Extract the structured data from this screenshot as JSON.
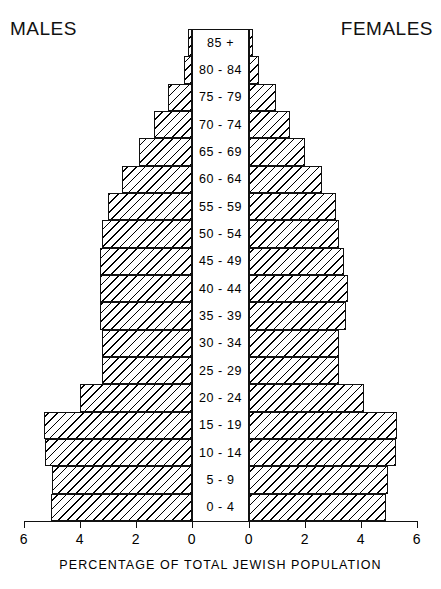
{
  "headers": {
    "left": "MALES",
    "right": "FEMALES"
  },
  "axis_title": "PERCENTAGE OF TOTAL JEWISH POPULATION",
  "chart_data": {
    "type": "bar",
    "subtype": "population-pyramid",
    "title": "",
    "xlabel": "PERCENTAGE OF TOTAL JEWISH POPULATION",
    "ylabel": "",
    "grid": false,
    "legend": [
      "MALES",
      "FEMALES"
    ],
    "legend_position": "top-left-and-top-right",
    "xlim": [
      0,
      6
    ],
    "xticks": [
      6,
      4,
      2,
      0,
      0,
      2,
      4,
      6
    ],
    "xtick_labels": [
      "6",
      "4",
      "2",
      "0",
      "0",
      "2",
      "4",
      "6"
    ],
    "categories": [
      "85 +",
      "80 - 84",
      "75 - 79",
      "70 - 74",
      "65 - 69",
      "60 - 64",
      "55 - 59",
      "50 - 54",
      "45 - 49",
      "40 - 44",
      "35 - 39",
      "30 - 34",
      "25 - 29",
      "20 - 24",
      "15 - 19",
      "10 - 14",
      "5 - 9",
      "0 - 4"
    ],
    "series": [
      {
        "name": "MALES",
        "side": "left",
        "values": [
          0.15,
          0.3,
          0.85,
          1.35,
          1.9,
          2.5,
          3.0,
          3.2,
          3.3,
          3.3,
          3.3,
          3.2,
          3.2,
          4.0,
          5.3,
          5.25,
          5.0,
          5.05
        ]
      },
      {
        "name": "FEMALES",
        "side": "right",
        "values": [
          0.15,
          0.35,
          0.95,
          1.45,
          2.0,
          2.6,
          3.1,
          3.2,
          3.4,
          3.55,
          3.45,
          3.2,
          3.2,
          4.1,
          5.3,
          5.25,
          4.95,
          4.9
        ]
      }
    ]
  }
}
